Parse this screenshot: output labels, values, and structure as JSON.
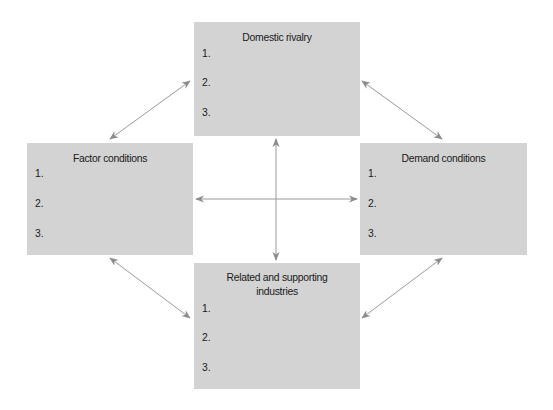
{
  "diagram": {
    "type": "Porter's Diamond",
    "boxes": {
      "top": {
        "title": "Domestic rivalry",
        "items": [
          "1.",
          "2.",
          "3."
        ]
      },
      "left": {
        "title": "Factor conditions",
        "items": [
          "1.",
          "2.",
          "3."
        ]
      },
      "right": {
        "title": "Demand conditions",
        "items": [
          "1.",
          "2.",
          "3."
        ]
      },
      "bottom": {
        "title_line1": "Related and supporting",
        "title_line2": "industries",
        "items": [
          "1.",
          "2.",
          "3."
        ]
      }
    },
    "colors": {
      "box_fill": "#d3d3d3",
      "arrow": "#8c8c8c"
    },
    "connections": [
      "Domestic rivalry <-> Factor conditions",
      "Domestic rivalry <-> Demand conditions",
      "Factor conditions <-> Related and supporting industries",
      "Demand conditions <-> Related and supporting industries",
      "Factor conditions <-> Demand conditions",
      "Domestic rivalry <-> Related and supporting industries"
    ]
  }
}
